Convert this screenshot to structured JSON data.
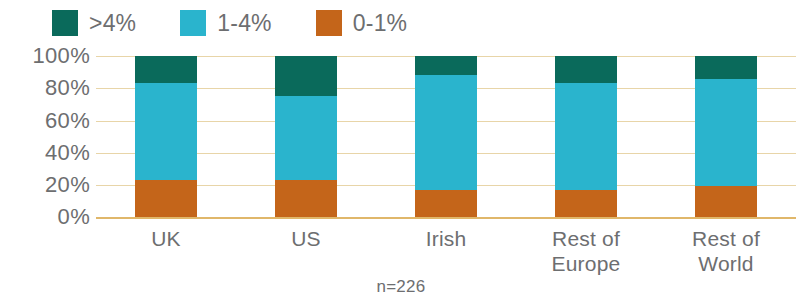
{
  "chart_data": {
    "type": "bar",
    "subtype": "stacked-100-percent",
    "title": "",
    "xlabel": "",
    "ylabel": "",
    "ylim": [
      0,
      100
    ],
    "y_ticks": [
      "0%",
      "20%",
      "40%",
      "60%",
      "80%",
      "100%"
    ],
    "y_tick_values": [
      0,
      20,
      40,
      60,
      80,
      100
    ],
    "grid": true,
    "legend_position": "top-left",
    "categories": [
      "UK",
      "US",
      "Irish",
      "Rest of Europe",
      "Rest of World"
    ],
    "category_label_lines": [
      [
        "UK"
      ],
      [
        "US"
      ],
      [
        "Irish"
      ],
      [
        "Rest of",
        "Europe"
      ],
      [
        "Rest of",
        "World"
      ]
    ],
    "series": [
      {
        "name": ">4%",
        "color": "#0a6a5b",
        "values": [
          17,
          25,
          12,
          17,
          14
        ]
      },
      {
        "name": "1-4%",
        "color": "#2ab4cd",
        "values": [
          60,
          52,
          71,
          66,
          67
        ]
      },
      {
        "name": "0-1%",
        "color": "#c4651a",
        "values": [
          23,
          23,
          17,
          17,
          19
        ]
      }
    ],
    "stack_order_bottom_to_top": [
      "0-1%",
      "1-4%",
      ">4%"
    ],
    "annotations": [
      "n=226"
    ],
    "footnote": "n=226"
  },
  "legend": {
    "items": [
      {
        "label": ">4%",
        "color": "#0a6a5b",
        "swatch_name": "legend-swatch-above-4"
      },
      {
        "label": "1-4%",
        "color": "#2ab4cd",
        "swatch_name": "legend-swatch-1-to-4"
      },
      {
        "label": "0-1%",
        "color": "#c4651a",
        "swatch_name": "legend-swatch-0-to-1"
      }
    ]
  },
  "colors": {
    "dark_teal": "#0a6a5b",
    "cyan": "#2ab4cd",
    "orange": "#c4651a",
    "gridline": "#e8d5a8",
    "baseline": "#e0b76a",
    "text": "#6d6e70",
    "background": "#ffffff"
  }
}
